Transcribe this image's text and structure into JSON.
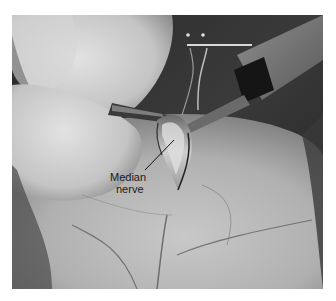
{
  "figure": {
    "annotation": {
      "line1": "Median",
      "line2": "nerve",
      "pointer": {
        "from": [
          145,
          170
        ],
        "to": [
          174,
          140
        ]
      }
    },
    "colors": {
      "background": "#ffffff",
      "skin_light": "#d2d2d2",
      "skin_mid": "#a8a8a8",
      "shadow": "#1c1c1c",
      "text": "#1a1a1a"
    }
  }
}
